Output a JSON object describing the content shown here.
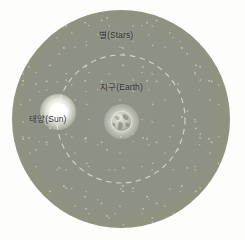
{
  "diagram": {
    "labels": {
      "stars": "별(Stars)",
      "earth": "지구(Earth)",
      "sun": "태양(Sun)"
    },
    "colors": {
      "field_fill": "#8e9186",
      "field_edge": "#c4c6bc",
      "orbit_dash": "#d9dbcf",
      "sun_body": "#ffffff",
      "earth_ocean": "#b9bcae",
      "earth_land": "#8d9082",
      "label_text": "#2b2b2b",
      "background": "#fdfdfc"
    },
    "elements": {
      "star_field": {
        "name": "star-field-sphere",
        "center_x": 121,
        "center_y": 119,
        "radius": 109
      },
      "orbit": {
        "name": "earth-orbit-path",
        "center_x": 121,
        "center_y": 119,
        "radius": 64,
        "style": "dashed"
      },
      "sun": {
        "name": "sun",
        "center_x": 58,
        "center_y": 112,
        "radius": 10
      },
      "earth": {
        "name": "earth",
        "center_x": 121,
        "center_y": 121,
        "radius": 11
      }
    }
  }
}
